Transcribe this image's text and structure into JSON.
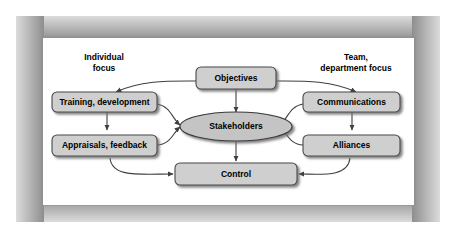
{
  "figure": {
    "background_color": "#ffffff",
    "panel_color": "#ffffff",
    "frame_color": "#9a9a9a",
    "node_fill": "#cfcfcf",
    "node_stroke": "#4a4a4a",
    "ellipse_fill": "#c4c4c4",
    "connector_color": "#3f3f3f"
  },
  "side_labels": [
    {
      "id": "individual-focus",
      "line1": "Individual",
      "line2": "focus"
    },
    {
      "id": "team-department-focus",
      "line1": "Team,",
      "line2": "department focus"
    }
  ],
  "nodes": [
    {
      "id": "objectives",
      "label": "Objectives",
      "shape": "rounded-rect"
    },
    {
      "id": "training-development",
      "label": "Training, development",
      "shape": "rounded-rect"
    },
    {
      "id": "appraisals-feedback",
      "label": "Appraisals, feedback",
      "shape": "rounded-rect"
    },
    {
      "id": "communications",
      "label": "Communications",
      "shape": "rounded-rect"
    },
    {
      "id": "alliances",
      "label": "Alliances",
      "shape": "rounded-rect"
    },
    {
      "id": "stakeholders",
      "label": "Stakeholders",
      "shape": "ellipse"
    },
    {
      "id": "control",
      "label": "Control",
      "shape": "rounded-rect"
    }
  ],
  "connectors": [
    {
      "id": "objectives-to-training",
      "from": "objectives",
      "to": "training-development",
      "style": "curved",
      "arrow": "end"
    },
    {
      "id": "objectives-to-communications",
      "from": "objectives",
      "to": "communications",
      "style": "curved",
      "arrow": "end"
    },
    {
      "id": "objectives-to-stakeholders",
      "from": "objectives",
      "to": "stakeholders",
      "style": "straight",
      "arrow": "end"
    },
    {
      "id": "training-to-appraisals",
      "from": "training-development",
      "to": "appraisals-feedback",
      "style": "straight",
      "arrow": "end"
    },
    {
      "id": "communications-to-alliances",
      "from": "communications",
      "to": "alliances",
      "style": "straight",
      "arrow": "end"
    },
    {
      "id": "training-to-stakeholders",
      "from": "training-development",
      "to": "stakeholders",
      "style": "curved",
      "arrow": "end"
    },
    {
      "id": "appraisals-to-stakeholders",
      "from": "appraisals-feedback",
      "to": "stakeholders",
      "style": "curved",
      "arrow": "end"
    },
    {
      "id": "communications-to-stakeholders",
      "from": "communications",
      "to": "stakeholders",
      "style": "curved",
      "arrow": "end"
    },
    {
      "id": "alliances-to-stakeholders",
      "from": "alliances",
      "to": "stakeholders",
      "style": "curved",
      "arrow": "end"
    },
    {
      "id": "stakeholders-to-control",
      "from": "stakeholders",
      "to": "control",
      "style": "straight",
      "arrow": "end"
    },
    {
      "id": "appraisals-to-control",
      "from": "appraisals-feedback",
      "to": "control",
      "style": "curved",
      "arrow": "end"
    },
    {
      "id": "alliances-to-control",
      "from": "alliances",
      "to": "control",
      "style": "curved",
      "arrow": "end"
    }
  ]
}
